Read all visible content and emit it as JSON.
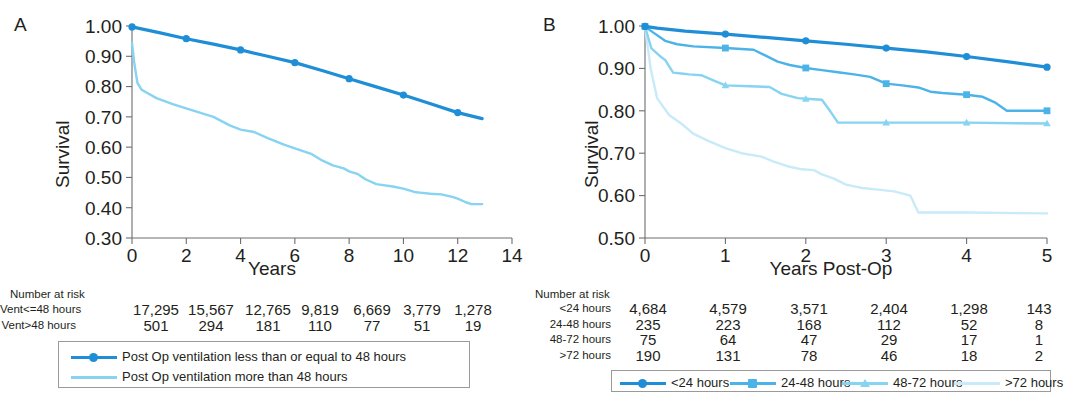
{
  "figure": {
    "panels": [
      "A",
      "B"
    ],
    "colors": {
      "dark_blue": "#1f8ed6",
      "medium_blue": "#4cb3e8",
      "light_blue": "#87d3f2",
      "pale_blue": "#c8eaf9",
      "axis": "#6d6e71",
      "text": "#231f20"
    }
  },
  "panel_a": {
    "letter": "A",
    "ylabel": "Survival",
    "xlabel": "Years",
    "risk_title": "Number at risk",
    "risk_rows": [
      {
        "label": "Vent<=48 hours",
        "values": [
          "17,295",
          "15,567",
          "12,765",
          "9,819",
          "6,669",
          "3,779",
          "1,278"
        ]
      },
      {
        "label": "Vent>48 hours",
        "values": [
          "501",
          "294",
          "181",
          "110",
          "77",
          "51",
          "19"
        ]
      }
    ],
    "legend": [
      {
        "label": "Post Op ventilation less than or equal to 48 hours",
        "marker": "dot",
        "color": "#1f8ed6"
      },
      {
        "label": "Post Op ventilation more than 48 hours",
        "marker": "none",
        "color": "#87d3f2"
      }
    ]
  },
  "panel_b": {
    "letter": "B",
    "ylabel": "Survival",
    "xlabel": "Years Post-Op",
    "risk_title": "Number at risk",
    "risk_rows": [
      {
        "label": "<24 hours",
        "values": [
          "4,684",
          "4,579",
          "3,571",
          "2,404",
          "1,298",
          "143"
        ]
      },
      {
        "label": "24-48 hours",
        "values": [
          "235",
          "223",
          "168",
          "112",
          "52",
          "8"
        ]
      },
      {
        "label": "48-72 hours",
        "values": [
          "75",
          "64",
          "47",
          "29",
          "17",
          "1"
        ]
      },
      {
        "label": ">72 hours",
        "values": [
          "190",
          "131",
          "78",
          "46",
          "18",
          "2"
        ]
      }
    ],
    "legend": [
      {
        "label": "<24 hours",
        "marker": "dot",
        "color": "#1f8ed6"
      },
      {
        "label": "24-48 hours",
        "marker": "square",
        "color": "#4cb3e8"
      },
      {
        "label": "48-72 hours",
        "marker": "triangle",
        "color": "#87d3f2"
      },
      {
        "label": ">72 hours",
        "marker": "none",
        "color": "#c8eaf9"
      }
    ]
  },
  "chart_data": [
    {
      "type": "line",
      "panel": "A",
      "title": "",
      "xlabel": "Years",
      "ylabel": "Survival",
      "xlim": [
        0,
        14
      ],
      "ylim": [
        0.3,
        1.0
      ],
      "xticks": [
        0,
        2,
        4,
        6,
        8,
        10,
        12,
        14
      ],
      "ytick_labels": [
        "1.00",
        "0.90",
        "0.80",
        "0.70",
        "0.60",
        "0.50",
        "0.40",
        "0.30"
      ],
      "yticks": [
        1.0,
        0.9,
        0.8,
        0.7,
        0.6,
        0.5,
        0.4,
        0.3
      ],
      "grid": false,
      "legend_position": "below",
      "series": [
        {
          "name": "Post Op ventilation less than or equal to 48 hours",
          "color": "#1f8ed6",
          "marker": "dot",
          "marker_x": [
            0,
            2,
            4,
            6,
            8,
            10,
            12
          ],
          "marker_y": [
            0.997,
            0.958,
            0.921,
            0.879,
            0.826,
            0.772,
            0.714
          ],
          "x": [
            0,
            1,
            2,
            3,
            4,
            5,
            6,
            7,
            8,
            9,
            10,
            11,
            12,
            12.9
          ],
          "y": [
            0.997,
            0.978,
            0.958,
            0.94,
            0.921,
            0.9,
            0.879,
            0.853,
            0.826,
            0.799,
            0.772,
            0.743,
            0.714,
            0.694
          ]
        },
        {
          "name": "Post Op ventilation more than 48 hours",
          "color": "#87d3f2",
          "marker": "none",
          "x": [
            0,
            0.08,
            0.2,
            0.35,
            0.5,
            0.9,
            1.5,
            2.2,
            3.0,
            3.6,
            4.0,
            4.5,
            5.0,
            5.6,
            6.0,
            6.6,
            7.0,
            7.4,
            7.8,
            8.0,
            8.3,
            8.6,
            9.0,
            9.6,
            10.0,
            10.4,
            10.6,
            11.0,
            11.4,
            11.8,
            12.0,
            12.3,
            12.5,
            12.9
          ],
          "y": [
            0.945,
            0.88,
            0.812,
            0.79,
            0.782,
            0.762,
            0.742,
            0.722,
            0.7,
            0.672,
            0.658,
            0.65,
            0.63,
            0.608,
            0.596,
            0.578,
            0.556,
            0.54,
            0.53,
            0.52,
            0.512,
            0.494,
            0.478,
            0.47,
            0.463,
            0.452,
            0.45,
            0.446,
            0.444,
            0.436,
            0.43,
            0.418,
            0.412,
            0.412
          ]
        }
      ]
    },
    {
      "type": "line",
      "panel": "B",
      "title": "",
      "xlabel": "Years Post-Op",
      "ylabel": "Survival",
      "xlim": [
        0,
        5
      ],
      "ylim": [
        0.5,
        1.0
      ],
      "xticks": [
        0,
        1,
        2,
        3,
        4,
        5
      ],
      "ytick_labels": [
        "1.00",
        "0.90",
        "0.80",
        "0.70",
        "0.60",
        "0.50"
      ],
      "yticks": [
        1.0,
        0.9,
        0.8,
        0.7,
        0.6,
        0.5
      ],
      "grid": false,
      "legend_position": "below",
      "series": [
        {
          "name": "<24 hours",
          "color": "#1f8ed6",
          "marker": "dot",
          "marker_x": [
            0,
            1,
            2,
            3,
            4,
            5
          ],
          "marker_y": [
            0.999,
            0.981,
            0.965,
            0.948,
            0.928,
            0.903
          ],
          "x": [
            0,
            0.15,
            0.5,
            1,
            1.5,
            2,
            2.5,
            3,
            3.5,
            4,
            4.5,
            5
          ],
          "y": [
            0.999,
            0.995,
            0.988,
            0.981,
            0.973,
            0.965,
            0.957,
            0.948,
            0.939,
            0.928,
            0.916,
            0.903
          ]
        },
        {
          "name": "24-48 hours",
          "color": "#4cb3e8",
          "marker": "square",
          "marker_x": [
            0,
            1,
            2,
            3,
            4,
            5
          ],
          "marker_y": [
            0.999,
            0.948,
            0.901,
            0.864,
            0.838,
            0.8
          ],
          "x": [
            0,
            0.1,
            0.25,
            0.4,
            0.6,
            1.0,
            1.35,
            1.5,
            1.65,
            1.8,
            2.0,
            2.2,
            2.4,
            2.6,
            2.8,
            3.0,
            3.2,
            3.4,
            3.55,
            3.7,
            4.0,
            4.2,
            4.35,
            4.5,
            5.0
          ],
          "y": [
            0.999,
            0.985,
            0.965,
            0.957,
            0.952,
            0.948,
            0.944,
            0.93,
            0.916,
            0.908,
            0.901,
            0.896,
            0.891,
            0.886,
            0.88,
            0.864,
            0.86,
            0.855,
            0.845,
            0.842,
            0.838,
            0.833,
            0.82,
            0.8,
            0.8
          ]
        },
        {
          "name": "48-72 hours",
          "color": "#87d3f2",
          "marker": "triangle",
          "marker_x": [
            0,
            1,
            2,
            3,
            4,
            5
          ],
          "marker_y": [
            0.999,
            0.86,
            0.828,
            0.772,
            0.772,
            0.77
          ],
          "x": [
            0,
            0.08,
            0.18,
            0.25,
            0.35,
            0.45,
            0.55,
            0.7,
            0.85,
            1.0,
            1.3,
            1.55,
            1.7,
            1.9,
            2.05,
            2.2,
            2.3,
            2.4,
            3.0,
            4.0,
            5.0
          ],
          "y": [
            0.999,
            0.947,
            0.93,
            0.92,
            0.89,
            0.888,
            0.886,
            0.884,
            0.872,
            0.86,
            0.858,
            0.856,
            0.84,
            0.83,
            0.828,
            0.826,
            0.8,
            0.772,
            0.772,
            0.772,
            0.77
          ]
        },
        {
          "name": ">72 hours",
          "color": "#c8eaf9",
          "marker": "none",
          "x": [
            0,
            0.07,
            0.15,
            0.3,
            0.45,
            0.6,
            0.8,
            1.0,
            1.2,
            1.45,
            1.6,
            1.8,
            1.95,
            2.1,
            2.2,
            2.35,
            2.5,
            2.7,
            2.9,
            3.1,
            3.3,
            3.4,
            4.0,
            5.0
          ],
          "y": [
            0.999,
            0.9,
            0.83,
            0.79,
            0.77,
            0.746,
            0.728,
            0.712,
            0.7,
            0.692,
            0.68,
            0.668,
            0.662,
            0.66,
            0.65,
            0.64,
            0.626,
            0.618,
            0.614,
            0.61,
            0.6,
            0.56,
            0.56,
            0.558
          ]
        }
      ]
    }
  ]
}
